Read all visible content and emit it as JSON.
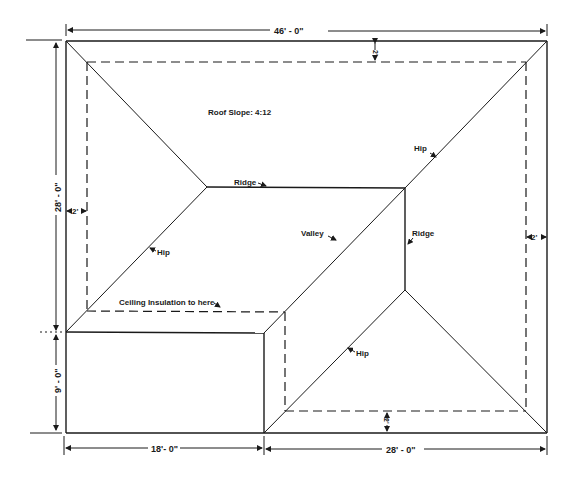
{
  "diagram": {
    "type": "roof-plan",
    "title": "",
    "annotations": {
      "roof_slope": "Roof Slope: 4:12",
      "ceiling_insulation": "Ceiling Insulation to here",
      "hip_upper_right": "Hip",
      "hip_left": "Hip",
      "hip_lower": "Hip",
      "ridge_horizontal": "Ridge",
      "ridge_vertical": "Ridge",
      "valley": "Valley"
    },
    "dimensions": {
      "overall_width": "46' - 0\"",
      "upper_depth": "28' - 0\"",
      "lower_left_depth": "9' - 0\"",
      "lower_left_width": "18'- 0\"",
      "lower_right_width": "28' - 0\"",
      "overhang_top": "2'",
      "overhang_left": "2'",
      "overhang_right": "2'",
      "overhang_bottom": "2'"
    },
    "colors": {
      "line": "#1a1a1a",
      "background": "#ffffff"
    }
  }
}
